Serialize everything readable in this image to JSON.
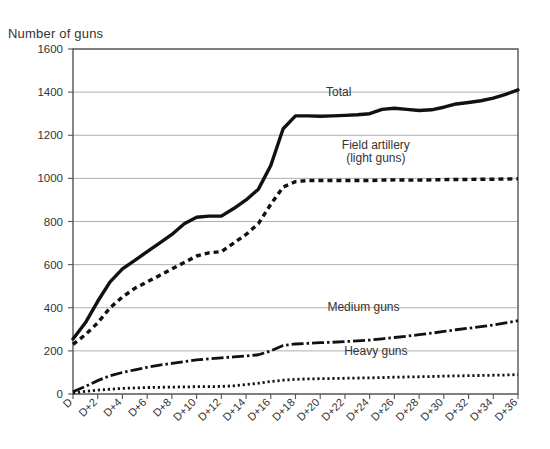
{
  "axis_title": "Number of guns",
  "chart_data": {
    "type": "line",
    "title": "",
    "subtitle": "",
    "xlabel": "",
    "ylabel": "Number of guns",
    "ylim": [
      0,
      1600
    ],
    "ytick_step": 200,
    "grid": true,
    "legend_position": "inline-annotations",
    "yticks": [
      "0",
      "200",
      "400",
      "600",
      "800",
      "1000",
      "1200",
      "1400",
      "1600"
    ],
    "categories": [
      "D",
      "D+1",
      "D+2",
      "D+3",
      "D+4",
      "D+5",
      "D+6",
      "D+7",
      "D+8",
      "D+9",
      "D+10",
      "D+11",
      "D+12",
      "D+13",
      "D+14",
      "D+15",
      "D+16",
      "D+17",
      "D+18",
      "D+19",
      "D+20",
      "D+21",
      "D+22",
      "D+23",
      "D+24",
      "D+25",
      "D+26",
      "D+27",
      "D+28",
      "D+29",
      "D+30",
      "D+31",
      "D+32",
      "D+33",
      "D+34",
      "D+35",
      "D+36"
    ],
    "xticklabels": [
      "D",
      "D+2",
      "D+4",
      "D+6",
      "D+8",
      "D+10",
      "D+12",
      "D+14",
      "D+16",
      "D+18",
      "D+20",
      "D+22",
      "D+24",
      "D+26",
      "D+28",
      "D+30",
      "D+32",
      "D+34",
      "D+36"
    ],
    "series": [
      {
        "name": "Total",
        "label": "Total",
        "style": "solid",
        "values": [
          255,
          330,
          430,
          520,
          580,
          620,
          660,
          700,
          740,
          790,
          820,
          825,
          825,
          860,
          900,
          950,
          1060,
          1230,
          1290,
          1290,
          1288,
          1290,
          1292,
          1295,
          1300,
          1320,
          1325,
          1320,
          1315,
          1318,
          1330,
          1345,
          1352,
          1360,
          1372,
          1390,
          1410
        ]
      },
      {
        "name": "Field artillery (light guns)",
        "label_line1": "Field artillery",
        "label_line2": "(light guns)",
        "style": "dashed",
        "values": [
          230,
          275,
          330,
          400,
          450,
          490,
          520,
          550,
          580,
          610,
          640,
          655,
          660,
          700,
          740,
          790,
          880,
          960,
          985,
          990,
          990,
          990,
          990,
          990,
          990,
          992,
          993,
          992,
          992,
          993,
          994,
          995,
          995,
          996,
          996,
          997,
          998
        ]
      },
      {
        "name": "Medium guns",
        "label": "Medium guns",
        "style": "dash-dot",
        "values": [
          10,
          35,
          62,
          85,
          100,
          112,
          124,
          134,
          142,
          150,
          158,
          163,
          168,
          172,
          176,
          182,
          200,
          225,
          232,
          235,
          238,
          240,
          243,
          246,
          250,
          256,
          262,
          268,
          275,
          282,
          290,
          298,
          305,
          312,
          320,
          330,
          340
        ]
      },
      {
        "name": "Heavy guns",
        "label": "Heavy guns",
        "style": "dotted",
        "values": [
          5,
          12,
          18,
          22,
          26,
          28,
          30,
          31,
          32,
          33,
          34,
          34,
          35,
          38,
          44,
          50,
          58,
          64,
          68,
          70,
          71,
          72,
          73,
          74,
          75,
          76,
          78,
          79,
          80,
          81,
          83,
          84,
          85,
          86,
          87,
          88,
          90
        ]
      }
    ],
    "annotations": [
      {
        "text": "Total",
        "x": 21.5,
        "y": 1380
      },
      {
        "text": "Field artillery",
        "x": 24.5,
        "y": 1135
      },
      {
        "text": "(light guns)",
        "x": 24.5,
        "y": 1075
      },
      {
        "text": "Medium guns",
        "x": 23.5,
        "y": 385
      },
      {
        "text": "Heavy guns",
        "x": 24.5,
        "y": 180
      }
    ]
  }
}
